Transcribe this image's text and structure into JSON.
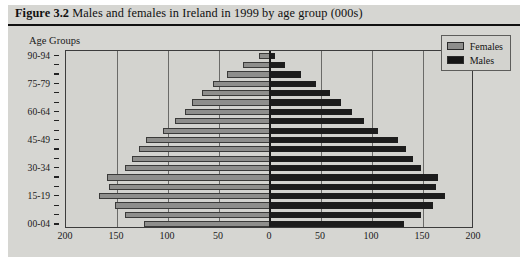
{
  "figure": {
    "number": "Figure 3.2",
    "caption": "Males and females in Ireland in 1999 by age group (000s)"
  },
  "axis_title": "Age Groups",
  "legend": {
    "position": "top-right",
    "items": [
      {
        "label": "Females",
        "color": "#8e8e8c",
        "swatch": "female"
      },
      {
        "label": "Males",
        "color": "#151515",
        "swatch": "male"
      }
    ]
  },
  "x_axis": {
    "tick_labels": [
      "200",
      "150",
      "100",
      "50",
      "0",
      "50",
      "100",
      "150",
      "200"
    ],
    "tick_values": [
      -200,
      -150,
      -100,
      -50,
      0,
      50,
      100,
      150,
      200
    ],
    "max": 200
  },
  "y_axis": {
    "labelled_ticks": [
      "90-94",
      "75-79",
      "60-64",
      "45-49",
      "30-34",
      "15-19",
      "00-04"
    ]
  },
  "chart_data": {
    "type": "bar",
    "title": "Males and females in Ireland in 1999 by age group (000s)",
    "subtitle": "",
    "xlabel": "",
    "ylabel": "Age Groups",
    "xlim": [
      -200,
      200
    ],
    "grid": true,
    "legend_position": "top-right",
    "orientation": "horizontal",
    "layout": "population-pyramid",
    "units": "thousands (000s)",
    "categories": [
      "00-04",
      "05-09",
      "10-14",
      "15-19",
      "20-24",
      "25-29",
      "30-34",
      "35-39",
      "40-44",
      "45-49",
      "50-54",
      "55-59",
      "60-64",
      "65-69",
      "70-74",
      "75-79",
      "80-84",
      "85-89",
      "90-94"
    ],
    "series": [
      {
        "name": "Females",
        "color": "#8e8e8c",
        "direction": "left",
        "values": [
          124,
          142,
          152,
          168,
          158,
          160,
          142,
          135,
          128,
          122,
          105,
          93,
          83,
          76,
          67,
          56,
          42,
          26,
          11
        ]
      },
      {
        "name": "Males",
        "color": "#151515",
        "direction": "right",
        "values": [
          131,
          148,
          160,
          172,
          163,
          165,
          148,
          140,
          133,
          125,
          106,
          92,
          80,
          70,
          59,
          45,
          30,
          15,
          5
        ]
      }
    ]
  }
}
